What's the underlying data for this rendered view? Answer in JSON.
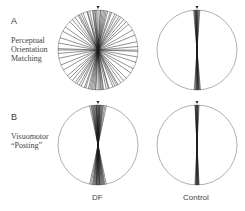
{
  "figure": {
    "panels": [
      {
        "letter": "A",
        "label_lines": [
          "Perceptual",
          "Orientation",
          "Matching"
        ]
      },
      {
        "letter": "B",
        "label_lines": [
          "Visuomotor",
          "“Posting”"
        ]
      }
    ],
    "columns": [
      "DF",
      "Control"
    ],
    "circles": [
      {
        "id": "A-DF",
        "cx": 98,
        "cy": 50,
        "r": 40,
        "angles_deg": [
          0,
          2,
          -3,
          5,
          -6,
          8,
          -10,
          12,
          -14,
          16,
          -20,
          22,
          -25,
          28,
          -32,
          35,
          -40,
          45,
          -50,
          55,
          -60,
          62,
          -68,
          72,
          -78,
          80,
          -85,
          88,
          90,
          -18,
          25,
          -35,
          40,
          -45,
          4,
          -4,
          7,
          -8,
          15,
          -12,
          30,
          -28
        ]
      },
      {
        "id": "A-Control",
        "cx": 197,
        "cy": 50,
        "r": 40,
        "angles_deg": [
          0,
          1,
          -1,
          2,
          -2,
          3,
          -3,
          4,
          2.5,
          1.5,
          -0.5,
          0.5,
          5,
          -4
        ]
      },
      {
        "id": "B-DF",
        "cx": 98,
        "cy": 145,
        "r": 40,
        "angles_deg": [
          0,
          1,
          -1,
          2,
          -2,
          3,
          -3,
          4,
          -4,
          5,
          -5,
          6,
          -6,
          7,
          -7,
          8,
          -8,
          9,
          10,
          -10,
          12,
          -12,
          2.5,
          -2.5,
          1.5,
          -1.5
        ]
      },
      {
        "id": "B-Control",
        "cx": 197,
        "cy": 145,
        "r": 40,
        "angles_deg": [
          0,
          0.5,
          -0.5,
          1,
          -1,
          1.5,
          -1.5,
          2,
          -2,
          2.5,
          3,
          -3
        ]
      }
    ]
  }
}
